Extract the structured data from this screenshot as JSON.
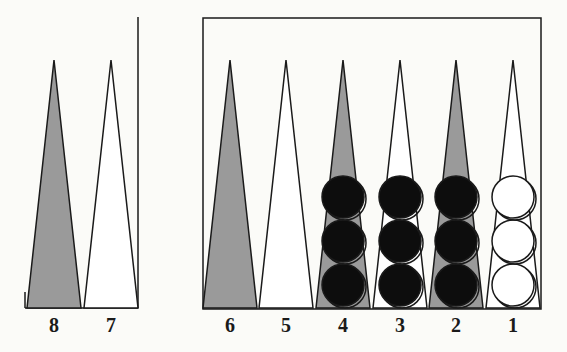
{
  "colors": {
    "background": "#fbfbf8",
    "line": "#1a1a1a",
    "dark_point": "#9a9a9a",
    "light_point": "#ffffff",
    "black_checker": "#0d0d0d",
    "white_checker": "#ffffff"
  },
  "board": {
    "points": [
      {
        "label": "8",
        "x": 54,
        "shade": "dark",
        "checkers": []
      },
      {
        "label": "7",
        "x": 111,
        "shade": "light",
        "checkers": []
      },
      {
        "label": "6",
        "x": 230,
        "shade": "dark",
        "checkers": []
      },
      {
        "label": "5",
        "x": 286,
        "shade": "light",
        "checkers": []
      },
      {
        "label": "4",
        "x": 343,
        "shade": "dark",
        "checkers": [
          "black",
          "black",
          "black"
        ]
      },
      {
        "label": "3",
        "x": 400,
        "shade": "light",
        "checkers": [
          "black",
          "black",
          "black"
        ]
      },
      {
        "label": "2",
        "x": 456,
        "shade": "dark",
        "checkers": [
          "black",
          "black",
          "black"
        ]
      },
      {
        "label": "1",
        "x": 513,
        "shade": "light",
        "checkers": [
          "white",
          "white",
          "white"
        ]
      }
    ]
  }
}
